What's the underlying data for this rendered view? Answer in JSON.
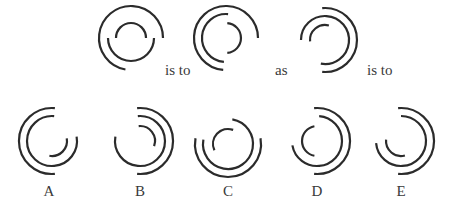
{
  "stroke_color": "#2b2b2b",
  "stroke_width": 2.2,
  "connectors": [
    {
      "text": "is to",
      "x": 165,
      "y": 63
    },
    {
      "text": "as",
      "x": 275,
      "y": 63
    },
    {
      "text": "is to",
      "x": 367,
      "y": 63
    }
  ],
  "figures": [
    {
      "id": "premise-1",
      "cx": 131,
      "cy": 38,
      "arcs": [
        {
          "r": 32,
          "start": 100,
          "end": 0,
          "dir": "cw"
        },
        {
          "r": 23,
          "start": 180,
          "end": 0,
          "dir": "ccw"
        },
        {
          "r": 15,
          "start": 180,
          "end": 0,
          "dir": "cw"
        }
      ]
    },
    {
      "id": "premise-2",
      "cx": 226,
      "cy": 38,
      "arcs": [
        {
          "r": 32,
          "start": 0,
          "end": 95,
          "dir": "ccw"
        },
        {
          "r": 24,
          "start": 275,
          "end": 95,
          "dir": "ccw"
        },
        {
          "r": 15,
          "start": 275,
          "end": 85,
          "dir": "cw"
        }
      ]
    },
    {
      "id": "premise-3",
      "cx": 325,
      "cy": 40,
      "arcs": [
        {
          "r": 32,
          "start": 265,
          "end": 95,
          "dir": "cw"
        },
        {
          "r": 24,
          "start": 180,
          "end": 100,
          "dir": "cw"
        },
        {
          "r": 15,
          "start": 175,
          "end": 285,
          "dir": "cw"
        }
      ]
    },
    {
      "id": "option-a",
      "label": "A",
      "cx": 52,
      "cy": 141,
      "arcs": [
        {
          "r": 33,
          "start": 275,
          "end": 85,
          "dir": "ccw"
        },
        {
          "r": 25,
          "start": 275,
          "end": 350,
          "dir": "ccw"
        },
        {
          "r": 15,
          "start": 350,
          "end": 100,
          "dir": "cw"
        }
      ]
    },
    {
      "id": "option-b",
      "label": "B",
      "cx": 140,
      "cy": 141,
      "arcs": [
        {
          "r": 33,
          "start": 265,
          "end": 95,
          "dir": "cw"
        },
        {
          "r": 25,
          "start": 265,
          "end": 190,
          "dir": "cw"
        },
        {
          "r": 15,
          "start": 265,
          "end": 20,
          "dir": "cw"
        }
      ]
    },
    {
      "id": "option-c",
      "label": "C",
      "cx": 228,
      "cy": 144,
      "arcs": [
        {
          "r": 33,
          "start": 190,
          "end": 350,
          "dir": "ccw"
        },
        {
          "r": 25,
          "start": 280,
          "end": 190,
          "dir": "cw"
        },
        {
          "r": 15,
          "start": 155,
          "end": 290,
          "dir": "cw"
        }
      ]
    },
    {
      "id": "option-d",
      "label": "D",
      "cx": 317,
      "cy": 141,
      "arcs": [
        {
          "r": 33,
          "start": 265,
          "end": 95,
          "dir": "cw"
        },
        {
          "r": 25,
          "start": 275,
          "end": 170,
          "dir": "cw"
        },
        {
          "r": 15,
          "start": 260,
          "end": 100,
          "dir": "ccw"
        }
      ]
    },
    {
      "id": "option-e",
      "label": "E",
      "cx": 401,
      "cy": 141,
      "arcs": [
        {
          "r": 33,
          "start": 265,
          "end": 95,
          "dir": "cw"
        },
        {
          "r": 25,
          "start": 270,
          "end": 175,
          "dir": "cw"
        },
        {
          "r": 15,
          "start": 185,
          "end": 75,
          "dir": "ccw"
        }
      ]
    }
  ],
  "option_labels": [
    {
      "text": "A",
      "x": 49,
      "y": 184
    },
    {
      "text": "B",
      "x": 140,
      "y": 184
    },
    {
      "text": "C",
      "x": 228,
      "y": 184
    },
    {
      "text": "D",
      "x": 317,
      "y": 184
    },
    {
      "text": "E",
      "x": 401,
      "y": 184
    }
  ]
}
